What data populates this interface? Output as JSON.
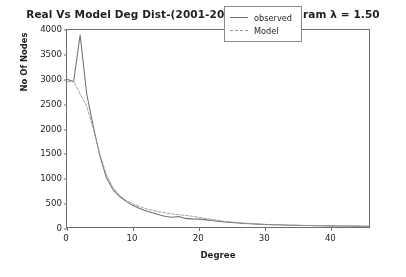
{
  "chart_data": {
    "type": "line",
    "title": "Real Vs Model Deg Dist-(2001-2006) Expon param λ = 1.50",
    "xlabel": "Degree",
    "ylabel": "No Of Nodes",
    "xlim": [
      0,
      46
    ],
    "ylim": [
      0,
      4000
    ],
    "xticks": [
      0,
      10,
      20,
      30,
      40
    ],
    "yticks": [
      0,
      500,
      1000,
      1500,
      2000,
      2500,
      3000,
      3500,
      4000
    ],
    "grid": false,
    "legend_position": "upper right",
    "x": [
      0,
      1,
      2,
      3,
      4,
      5,
      6,
      7,
      8,
      9,
      10,
      11,
      12,
      13,
      14,
      15,
      16,
      17,
      18,
      19,
      20,
      21,
      22,
      23,
      24,
      25,
      26,
      27,
      28,
      29,
      30,
      31,
      32,
      33,
      34,
      35,
      36,
      37,
      38,
      39,
      40,
      41,
      42,
      43,
      44,
      45,
      46
    ],
    "series": [
      {
        "name": "observed",
        "color": "#6f6f6f",
        "style": "solid",
        "values": [
          3000,
          2950,
          3900,
          2700,
          2050,
          1450,
          1000,
          760,
          620,
          520,
          440,
          380,
          330,
          290,
          250,
          215,
          200,
          215,
          175,
          165,
          160,
          150,
          130,
          115,
          100,
          90,
          80,
          72,
          65,
          58,
          52,
          48,
          44,
          40,
          37,
          34,
          31,
          29,
          27,
          25,
          23,
          22,
          20,
          19,
          18,
          17,
          16
        ]
      },
      {
        "name": "Model",
        "color": "#9a9a9a",
        "style": "dashed",
        "values": [
          2950,
          2960,
          2700,
          2450,
          2000,
          1480,
          1060,
          800,
          640,
          540,
          470,
          420,
          375,
          340,
          310,
          285,
          265,
          250,
          235,
          220,
          200,
          178,
          155,
          135,
          118,
          103,
          90,
          79,
          70,
          62,
          55,
          49,
          45,
          41,
          37,
          34,
          31,
          29,
          27,
          25,
          23,
          22,
          20,
          19,
          18,
          17,
          16
        ]
      }
    ]
  },
  "legend": {
    "items": [
      {
        "label": "observed"
      },
      {
        "label": "Model"
      }
    ]
  }
}
